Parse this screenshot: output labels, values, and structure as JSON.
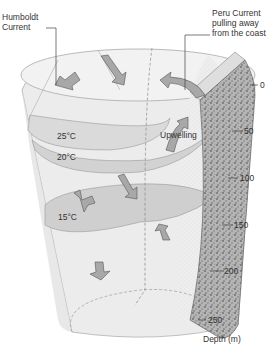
{
  "diagram": {
    "callouts": {
      "humboldt": [
        "Humboldt",
        "Current"
      ],
      "peru": [
        "Peru Current",
        "pulling away",
        "from the coast"
      ]
    },
    "layers": {
      "t25": "25°C",
      "t20": "20°C",
      "t15": "15°C"
    },
    "upwelling": "Upwelling",
    "depth_axis": {
      "ticks": [
        "0",
        "50",
        "100",
        "150",
        "200",
        "250"
      ],
      "label": "Depth (m)"
    },
    "colors": {
      "water": "#ededed",
      "isotherm_fill": "#d6d6d6",
      "arrow": "#a9a9a9",
      "coast": "#9a9a9a"
    }
  }
}
